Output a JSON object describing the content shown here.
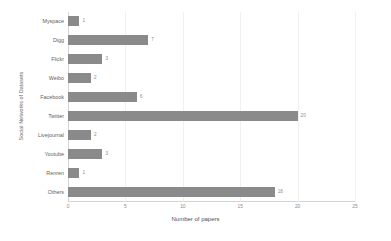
{
  "chart_data": {
    "type": "bar",
    "orientation": "horizontal",
    "title": "",
    "xlabel": "Number of papers",
    "ylabel": "Social Networks of Datasets",
    "categories": [
      "Myspace",
      "Digg",
      "Flickr",
      "Weibo",
      "Facebook",
      "Twitter",
      "Livejournal",
      "Youtube",
      "Renren",
      "Others"
    ],
    "values": [
      1,
      7,
      3,
      2,
      6,
      20,
      2,
      3,
      1,
      18
    ],
    "xlim": [
      0,
      25
    ],
    "xticks": [
      "0",
      "5",
      "10",
      "15",
      "20",
      "25"
    ],
    "xtick_values": [
      0,
      5,
      10,
      15,
      20,
      25
    ],
    "grid": "vertical",
    "legend": "none",
    "bar_color": "#8a8a8a",
    "data_labels": [
      "1",
      "7",
      "3",
      "2",
      "6",
      "20",
      "2",
      "3",
      "1",
      "18"
    ]
  },
  "colors": {
    "bar": "#8a8a8a",
    "gridline": "#f0f0f0",
    "axis": "#d4d4d4",
    "label_text": "#5f5f5f",
    "tick_text": "#8a8a8a",
    "background": "#ffffff"
  }
}
